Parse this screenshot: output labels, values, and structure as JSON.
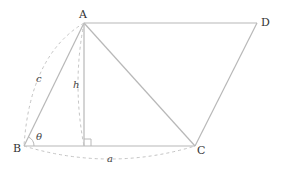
{
  "diagram": {
    "type": "parallelogram-geometry",
    "vertices": {
      "A": {
        "label": "A",
        "x": 84,
        "y": 23
      },
      "B": {
        "label": "B",
        "x": 24,
        "y": 146
      },
      "C": {
        "label": "C",
        "x": 195,
        "y": 146
      },
      "D": {
        "label": "D",
        "x": 257,
        "y": 23
      }
    },
    "labels": {
      "side_c": "c",
      "height_h": "h",
      "side_a": "a",
      "angle": "θ"
    },
    "colors": {
      "edge": "#b8b8b8",
      "dashed": "#c4c4c4",
      "text": "#333333"
    }
  }
}
